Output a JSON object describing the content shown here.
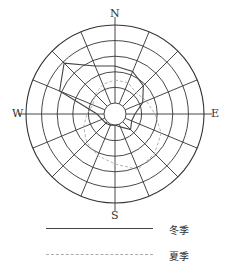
{
  "chart_data": {
    "type": "radar",
    "title": "",
    "directions": [
      "N",
      "NNE",
      "NE",
      "ENE",
      "E",
      "ESE",
      "SE",
      "SSE",
      "S",
      "SSW",
      "SW",
      "WSW",
      "W",
      "WNW",
      "NW",
      "NNW"
    ],
    "axis_labels": {
      "north": "N",
      "east": "E",
      "south": "S",
      "west": "W"
    },
    "grid": {
      "rings": 5,
      "spokes": 16,
      "calm_circle": true
    },
    "series": [
      {
        "name": "冬季",
        "style": "solid",
        "values": [
          48,
          46,
          40,
          30,
          20,
          18,
          22,
          14,
          11,
          12,
          13,
          14,
          18,
          60,
          72,
          52
        ]
      },
      {
        "name": "夏季",
        "style": "dashed",
        "values": [
          34,
          34,
          30,
          34,
          40,
          50,
          56,
          60,
          50,
          45,
          40,
          34,
          28,
          24,
          28,
          32
        ]
      }
    ],
    "legend": [
      {
        "label": "冬季",
        "style": "solid"
      },
      {
        "label": "夏季",
        "style": "dashed"
      }
    ],
    "legend_position": "bottom"
  },
  "labels": {
    "north": "N",
    "east": "E",
    "south": "S",
    "west": "W"
  },
  "legend": {
    "winter": "冬季",
    "summer": "夏季"
  },
  "colors": {
    "grid": "#333333",
    "winter": "#444444",
    "summer": "#aaaaaa"
  }
}
